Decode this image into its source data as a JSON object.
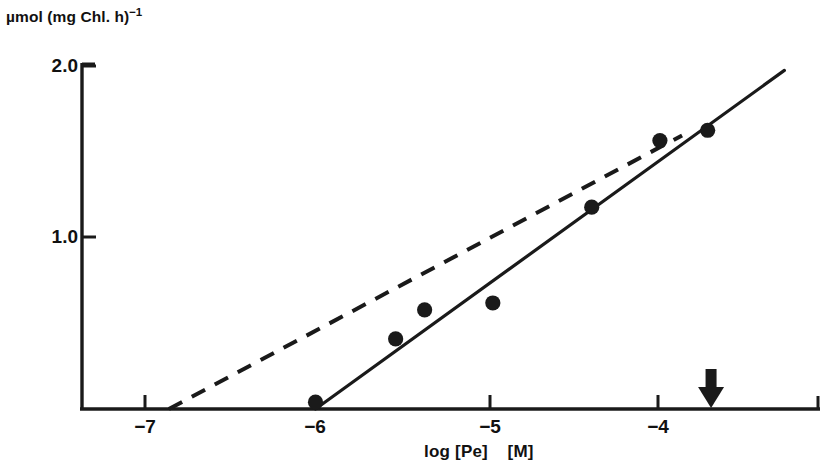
{
  "figure": {
    "background_color": "#ffffff",
    "ink_color": "#1a1a1a",
    "width": 830,
    "height": 470
  },
  "labels": {
    "y_axis_unit_main": "µmol (mg Chl. h)",
    "y_axis_unit_exponent": "−1",
    "x_axis_title": "log [Pe]    [M]"
  },
  "chart_data": {
    "type": "scatter",
    "title": "",
    "subtitle": "",
    "xlabel": "log [Pe]    [M]",
    "ylabel": "µmol (mg Chl. h)−1",
    "xlim": [
      -7.35,
      -3.05
    ],
    "ylim": [
      0.0,
      2.08
    ],
    "grid": false,
    "legend": "none",
    "xticks": [
      -7,
      -6,
      -5,
      -4
    ],
    "xtick_labels": [
      "−7",
      "−6",
      "−5",
      "−4"
    ],
    "yticks": [
      1.0,
      2.0
    ],
    "ytick_labels": [
      "1.0",
      "2.0"
    ],
    "series": [
      {
        "name": "measured rate",
        "type": "scatter",
        "marker": "filled-circle",
        "marker_color": "#1a1a1a",
        "x": [
          -6.0,
          -5.53,
          -5.36,
          -4.96,
          -4.38,
          -3.98,
          -3.7
        ],
        "y": [
          0.04,
          0.41,
          0.58,
          0.62,
          1.18,
          1.57,
          1.63
        ]
      },
      {
        "name": "solid fit line",
        "type": "line",
        "style": "solid",
        "color": "#1a1a1a",
        "x": [
          -6.0,
          -3.25
        ],
        "y": [
          0.0,
          1.98
        ]
      },
      {
        "name": "dashed reference line",
        "type": "line",
        "style": "dashed",
        "color": "#1a1a1a",
        "x": [
          -6.86,
          -3.85
        ],
        "y": [
          0.0,
          1.6
        ]
      }
    ],
    "annotations": [
      {
        "name": "down-arrow-marker",
        "symbol": "down-arrow",
        "x": -3.68,
        "y": 0.0,
        "color": "#1a1a1a"
      }
    ]
  }
}
